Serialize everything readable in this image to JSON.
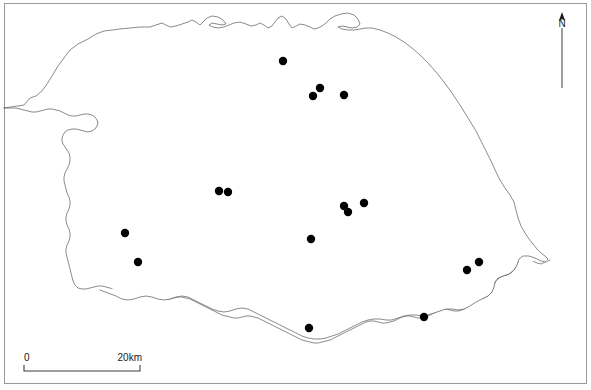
{
  "figure": {
    "name": "distribution-map",
    "region_name": "Norfolk",
    "background_color": "#ffffff",
    "frame_color": "#9a9a9a",
    "outline_color": "#595959",
    "dot_color": "#000000"
  },
  "north_arrow": {
    "label": "N",
    "x": 562,
    "stem_top": 28,
    "stem_bottom": 88
  },
  "scale_bar": {
    "start_label": "0",
    "end_label": "20km",
    "x_start": 24,
    "x_end": 140,
    "y": 371,
    "tick_height": 6
  },
  "sites": {
    "count": 16,
    "radius": 4.2,
    "points": [
      {
        "id": "site-1",
        "x": 283,
        "y": 61
      },
      {
        "id": "site-2",
        "x": 320,
        "y": 88
      },
      {
        "id": "site-3",
        "x": 313,
        "y": 96
      },
      {
        "id": "site-4",
        "x": 344,
        "y": 95
      },
      {
        "id": "site-5",
        "x": 219,
        "y": 191
      },
      {
        "id": "site-6",
        "x": 228,
        "y": 192
      },
      {
        "id": "site-7",
        "x": 344,
        "y": 206
      },
      {
        "id": "site-8",
        "x": 348,
        "y": 212
      },
      {
        "id": "site-9",
        "x": 364,
        "y": 203
      },
      {
        "id": "site-10",
        "x": 125,
        "y": 233
      },
      {
        "id": "site-11",
        "x": 311,
        "y": 239
      },
      {
        "id": "site-12",
        "x": 138,
        "y": 262
      },
      {
        "id": "site-13",
        "x": 479,
        "y": 262
      },
      {
        "id": "site-14",
        "x": 467,
        "y": 270
      },
      {
        "id": "site-15",
        "x": 424,
        "y": 317
      },
      {
        "id": "site-16",
        "x": 309,
        "y": 328
      }
    ]
  },
  "outline": {
    "path": "M 4 108 L 24 105 L 30 98 L 36 96 L 42 91 L 47 84 L 52 76 L 58 66 L 64 58 L 70 50 L 78 44 L 88 39 L 96 34 L 104 31 L 112 30 L 120 29 L 130 28 L 140 27 L 150 27 L 156 25 L 162 23 L 166 25 L 170 27 L 176 26 L 182 24 L 188 22 L 192 20 L 196 22 L 200 25 L 203 22 L 207 18 L 212 16 L 218 17 L 223 20 L 226 24 L 222 25 L 217 24 L 212 23 L 209 25 L 213 27 L 218 28 L 224 27 L 229 25 L 234 23 L 240 22 L 246 24 L 251 26 L 256 25 L 260 23 L 264 25 L 268 28 L 272 26 L 275 22 L 278 18 L 282 16 L 286 19 L 289 24 L 292 28 L 296 26 L 300 24 L 305 25 L 310 27 L 314 29 L 318 28 L 322 26 L 326 23 L 330 19 L 335 16 L 341 14 L 348 13 L 354 15 L 358 19 L 360 24 L 357 27 L 352 28 L 347 27 L 342 26 L 338 27 L 342 29 L 348 30 L 354 30 L 360 29 L 366 28 L 372 28 L 380 30 L 388 33 L 396 37 L 404 42 L 412 48 L 420 55 L 428 63 L 436 72 L 444 82 L 452 93 L 460 105 L 468 118 L 476 131 L 482 143 L 487 153 L 492 163 L 496 172 L 500 180 L 505 188 L 510 195 L 514 202 L 516 210 L 518 218 L 521 226 L 525 233 L 529 239 L 533 244 L 537 249 L 541 253 L 545 256 L 548 259 L 545 262 L 541 264 L 537 263 L 533 261 L 529 259 L 525 258 L 521 259 L 518 262 L 516 266 L 514 270 L 511 273 L 507 275 L 503 276 L 499 278 L 496 281 L 494 285 L 493 289 L 491 293 L 488 296 L 484 298 L 480 299 L 476 300 L 472 302 L 469 305 L 466 308 L 462 310 L 458 311 L 454 311 L 450 310 L 446 309 L 442 309 L 438 311 L 434 313 L 430 315 L 426 317 L 422 318 L 418 318 L 414 317 L 410 316 L 406 316 L 402 317 L 398 319 L 394 321 L 390 322 L 386 323 L 382 323 L 378 322 L 374 321 L 370 321 L 366 322 L 362 324 L 358 326 L 354 328 L 350 330 L 346 332 L 342 334 L 338 336 L 334 338 L 330 340 L 326 341 L 322 342 L 318 343 L 314 343 L 310 342 L 306 341 L 302 340 L 298 338 L 294 336 L 290 334 L 286 332 L 282 330 L 278 328 L 274 326 L 270 324 L 266 322 L 262 320 L 258 318 L 254 317 L 250 316 L 246 316 L 242 317 L 238 318 L 234 318 L 230 317 L 226 316 L 222 315 L 218 313 L 214 311 L 210 309 L 206 307 L 202 305 L 198 303 L 194 301 L 190 299 L 186 298 L 182 297 L 178 297 L 174 298 L 170 299 L 166 299 L 162 298 L 158 296 L 154 294 L 150 293 L 146 292 L 142 292 L 138 293 L 134 294 L 130 295 L 126 295 L 122 294 L 118 292 L 114 290 L 110 288 L 106 287 L 102 286 L 98 286 L 94 287 L 90 288 L 86 289 L 82 289 L 78 288 L 75 285 L 73 281 L 72 277 L 71 273 L 70 269 L 69 265 L 68 261 L 67 257 L 66 253 L 66 249 L 67 245 L 69 241 L 70 237 L 70 233 L 69 229 L 67 225 L 66 221 L 66 217 L 67 213 L 69 209 L 70 205 L 70 201 L 69 197 L 67 193 L 66 189 L 65 185 L 64 181 L 64 177 L 65 173 L 67 169 L 69 165 L 70 161 L 70 157 L 69 153 L 67 150 L 65 147 L 63 144 L 62 141 L 62 138 L 63 135 L 65 132 L 68 130 L 72 129 L 76 129 L 80 130 L 84 131 L 88 132 L 92 131 L 95 129 L 97 126 L 98 123 L 97 120 L 95 117 L 92 115 L 88 114 L 84 114 L 80 115 L 76 116 L 72 116 L 68 115 L 64 113 L 60 111 L 56 110 L 52 109 L 48 109 L 44 110 L 40 111 L 36 112 L 32 112 L 28 111 L 24 110 L 20 109 L 16 108 L 10 108 L 4 108",
    "inner_south_path": "M 100 290 L 108 293 L 116 296 L 122 299 L 128 300 L 134 299 L 140 297 L 146 296 L 152 297 L 158 299 L 164 300 L 170 299 L 176 297 L 182 296 L 188 297 L 194 300 L 200 303 L 206 306 L 212 309 L 218 311 L 224 312 L 230 311 L 236 309 L 242 308 L 248 309 L 254 312 L 260 315 L 266 318 L 272 321 L 278 324 L 284 327 L 290 330 L 296 333 L 302 336 L 308 338 L 314 339 L 320 339 L 326 338 L 332 336 L 338 334 L 344 331 L 350 328 L 356 325 L 362 322 L 368 320 L 374 319 L 380 319 L 386 320 L 392 320 L 398 318 L 404 316 L 410 315 L 416 315 L 422 316 L 428 315 L 434 313 L 440 311 L 446 309 L 452 309 L 458 310 L 464 309 L 470 306 L 476 302 L 482 299 L 488 296 L 492 292 L 494 287 L 495 282 L 498 278 L 503 276 L 509 274 L 514 270 L 517 265 L 519 259 L 523 256 L 529 256 L 535 258 L 541 261 L 546 262 L 550 260"
  }
}
